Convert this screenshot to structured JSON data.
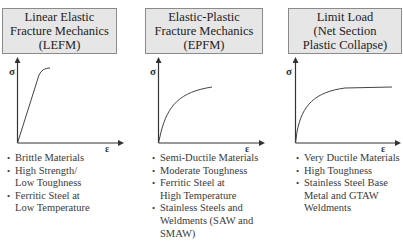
{
  "panels": [
    {
      "title_lines": [
        "Linear Elastic",
        "Fracture Mechanics",
        "(LEFM)"
      ],
      "axis": {
        "y_label": "σ",
        "x_label": "ε"
      },
      "curve": "linear-elastic",
      "bullets": [
        {
          "lines": [
            "Brittle Materials"
          ]
        },
        {
          "lines": [
            "High Strength/",
            "Low Toughness"
          ]
        },
        {
          "lines": [
            "Ferritic Steel at",
            "Low Temperature"
          ]
        }
      ]
    },
    {
      "title_lines": [
        "Elastic-Plastic",
        "Fracture Mechanics",
        "(EPFM)"
      ],
      "axis": {
        "y_label": "σ",
        "x_label": "ε"
      },
      "curve": "elastic-plastic",
      "bullets": [
        {
          "lines": [
            "Semi-Ductile Materials"
          ]
        },
        {
          "lines": [
            "Moderate Toughness"
          ]
        },
        {
          "lines": [
            "Ferritic Steel at",
            "High Temperature"
          ]
        },
        {
          "lines": [
            "Stainless Steels and",
            "Weldments (SAW and",
            "SMAW)"
          ]
        }
      ]
    },
    {
      "title_lines": [
        "Limit Load",
        "(Net Section",
        "Plastic Collapse)"
      ],
      "axis": {
        "y_label": "σ",
        "x_label": "ε"
      },
      "curve": "limit-load",
      "bullets": [
        {
          "lines": [
            "Very Ductile Materials"
          ]
        },
        {
          "lines": [
            "High Toughness"
          ]
        },
        {
          "lines": [
            "Stainless Steel Base",
            "Metal and GTAW",
            "Weldments"
          ]
        }
      ]
    }
  ],
  "bullet_glyph": "•",
  "colors": {
    "title_box_fill": "#e6e6e6",
    "title_box_border": "#8a8a8a",
    "axis": "#333333",
    "text": "#3a3a3a"
  }
}
